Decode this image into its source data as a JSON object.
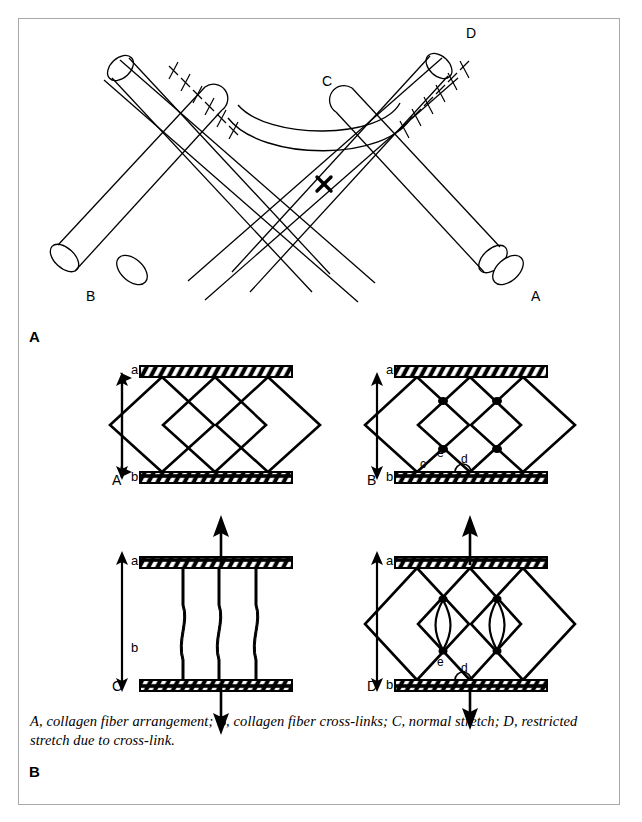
{
  "figure": {
    "panel_a_letter": "A",
    "panel_b_letter": "B",
    "caption": "A, collagen fiber arrangement; B, collagen fiber cross-links; C, normal stretch; D, restricted stretch due to cross-link."
  },
  "panel_a": {
    "title": "crossed collagen fibers with sutured cross-link",
    "labels": {
      "fiber_left_end": "B",
      "fiber_right_end": "A",
      "arc_label": "C",
      "upper_right_label": "D",
      "crossing_mark": "X"
    }
  },
  "panel_b": {
    "subpanels": [
      {
        "letter": "A",
        "name": "collagen-fiber-arrangement",
        "top_plate_label": "a",
        "bottom_plate_label": "b",
        "arrow": "double-headed",
        "node_labels": []
      },
      {
        "letter": "B",
        "name": "collagen-fiber-cross-links",
        "top_plate_label": "a",
        "bottom_plate_label": "b",
        "arrow": "double-headed",
        "node_labels": [
          "c",
          "e",
          "d"
        ]
      },
      {
        "letter": "C",
        "name": "normal-stretch",
        "top_plate_label": "a",
        "bottom_plate_label": "b",
        "arrow": "double-headed",
        "stretch_arrows": [
          "up",
          "down"
        ],
        "node_labels": []
      },
      {
        "letter": "D",
        "name": "restricted-stretch-due-to-cross-link",
        "top_plate_label": "a",
        "bottom_plate_label": "b",
        "arrow": "double-headed",
        "stretch_arrows": [
          "up",
          "down"
        ],
        "node_labels": [
          "e",
          "d"
        ]
      }
    ]
  },
  "colors": {
    "ink": "#000000",
    "paper": "#ffffff",
    "frame": "#a9a9a9"
  }
}
